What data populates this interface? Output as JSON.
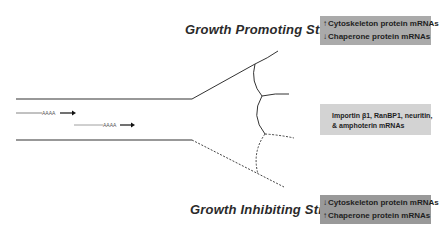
{
  "diagram": {
    "type": "axon growth cone schematic",
    "titles": {
      "promoting": "Growth Promoting Stimuli",
      "inhibiting": "Growth Inhibiting Stimuli"
    },
    "boxes": {
      "top": {
        "lines": [
          {
            "arrow": "↑",
            "text": "Cytoskeleton protein mRNAs"
          },
          {
            "arrow": "↓",
            "text": "Chaperone protein mRNAs"
          }
        ],
        "color": "#aaaaaa"
      },
      "middle": {
        "lines": [
          {
            "text": "Importin β1, RanBP1, neuritin,"
          },
          {
            "text": "& amphoterin mRNAs"
          }
        ],
        "color": "#d3d3d3"
      },
      "bottom": {
        "lines": [
          {
            "arrow": "↓",
            "text": "Cytoskeleton protein mRNAs"
          },
          {
            "arrow": "↑",
            "text": "Chaperone protein mRNAs"
          }
        ],
        "color": "#999999"
      }
    },
    "mrna_labels": [
      "AAAA",
      "AAAA"
    ]
  }
}
